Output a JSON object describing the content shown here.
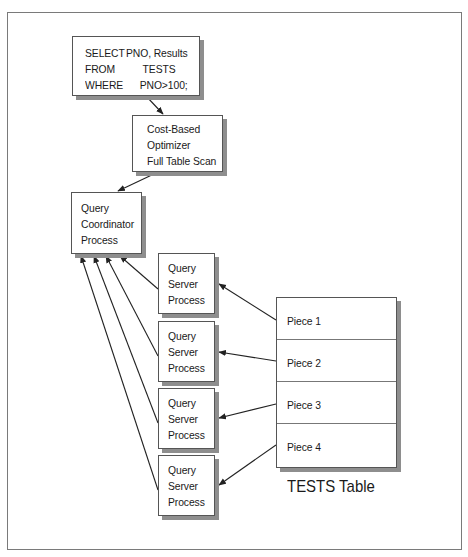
{
  "sql_box": {
    "rows": [
      {
        "keyword": "SELECT",
        "value": "PNO, Results"
      },
      {
        "keyword": "FROM",
        "value": "TESTS"
      },
      {
        "keyword": "WHERE",
        "value": "PNO>100;"
      }
    ]
  },
  "optimizer_box": {
    "lines": [
      "Cost-Based",
      "Optimizer",
      "Full Table Scan"
    ]
  },
  "coordinator_box": {
    "lines": [
      "Query",
      "Coordinator",
      "Process"
    ]
  },
  "server_boxes": [
    {
      "lines": [
        "Query",
        "Server",
        "Process"
      ]
    },
    {
      "lines": [
        "Query",
        "Server",
        "Process"
      ]
    },
    {
      "lines": [
        "Query",
        "Server",
        "Process"
      ]
    },
    {
      "lines": [
        "Query",
        "Server",
        "Process"
      ]
    }
  ],
  "table": {
    "pieces": [
      "Piece 1",
      "Piece 2",
      "Piece 3",
      "Piece 4"
    ],
    "caption": "TESTS Table"
  },
  "colors": {
    "box_border": "#555555",
    "shadow": "#8e8e8e",
    "arrow": "#222222",
    "frame": "#7a7a7a"
  }
}
